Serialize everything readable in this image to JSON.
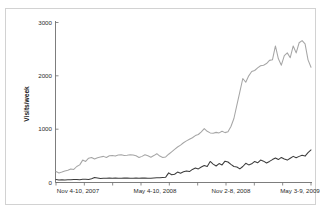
{
  "figure": {
    "background_color": "#ffffff",
    "frame_border_color": "#d2d2d2"
  },
  "chart_data": {
    "type": "line",
    "title": "",
    "xlabel": "",
    "ylabel": "Visits/week",
    "ylim": [
      0,
      3000
    ],
    "yticks": [
      0,
      1000,
      2000,
      3000
    ],
    "ytick_labels": [
      "0",
      "1000",
      "2000",
      "3000"
    ],
    "grid": false,
    "legend": null,
    "xtick_labels": [
      "Nov 4-10, 2007",
      "May 4-10, 2008",
      "Nov 2-8, 2008",
      "May 3-9, 2009"
    ],
    "xtick_positions": [
      0,
      26,
      52,
      78
    ],
    "x_minor_tick_count": 9,
    "x_index_range": [
      0,
      86
    ],
    "x_axis_description": "Weeks from Nov 4-10 2007 through May 3-9 2009",
    "series": [
      {
        "name": "upper-series",
        "color": "#a6a6a6",
        "values": [
          205,
          180,
          195,
          215,
          230,
          255,
          245,
          300,
          330,
          420,
          395,
          455,
          470,
          440,
          465,
          480,
          490,
          470,
          500,
          505,
          495,
          515,
          520,
          505,
          510,
          520,
          515,
          500,
          470,
          490,
          520,
          500,
          475,
          505,
          540,
          495,
          470,
          480,
          530,
          575,
          620,
          665,
          700,
          745,
          780,
          810,
          840,
          880,
          900,
          950,
          1010,
          960,
          930,
          925,
          940,
          930,
          960,
          935,
          950,
          1050,
          1200,
          1450,
          1700,
          1950,
          1880,
          2000,
          2080,
          2100,
          2150,
          2190,
          2200,
          2230,
          2290,
          2300,
          2560,
          2320,
          2200,
          2380,
          2430,
          2340,
          2560,
          2430,
          2620,
          2660,
          2600,
          2300,
          2160
        ]
      },
      {
        "name": "lower-series",
        "color": "#3c3c3c",
        "values": [
          55,
          45,
          50,
          48,
          52,
          50,
          55,
          58,
          52,
          60,
          62,
          58,
          72,
          95,
          85,
          75,
          80,
          78,
          82,
          80,
          85,
          80,
          78,
          82,
          85,
          80,
          78,
          82,
          80,
          85,
          82,
          78,
          80,
          85,
          88,
          90,
          95,
          100,
          180,
          145,
          155,
          195,
          175,
          200,
          215,
          205,
          245,
          270,
          255,
          290,
          320,
          300,
          395,
          345,
          310,
          355,
          330,
          400,
          385,
          340,
          300,
          290,
          255,
          300,
          360,
          330,
          350,
          395,
          370,
          420,
          400,
          365,
          395,
          430,
          460,
          430,
          470,
          440,
          420,
          455,
          490,
          465,
          490,
          510,
          495,
          560,
          610
        ]
      }
    ]
  }
}
